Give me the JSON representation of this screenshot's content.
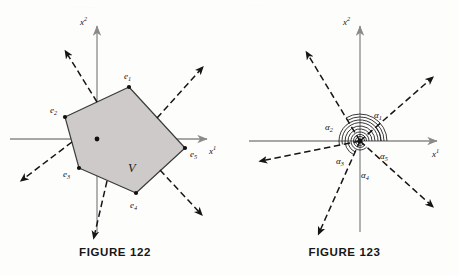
{
  "page": {
    "background": "#fdfdfc",
    "ink": "#101010",
    "axis_color": "#8a8a8a",
    "polygon_fill": "#cdcac9",
    "polygon_stroke": "#3a3a3a"
  },
  "figures": [
    {
      "id": "figure-122",
      "caption": "FIGURE 122",
      "axes": {
        "x_label": "x",
        "x_superscript": "1",
        "y_label": "x",
        "y_superscript": "2",
        "origin": {
          "x": 97,
          "y": 139
        }
      },
      "region_label": "V",
      "region_label_pos": {
        "x": 128,
        "y": 170
      },
      "vertices": [
        {
          "name": "e",
          "sub": "1",
          "x": 129,
          "y": 87,
          "label_x": 125,
          "label_y": 79
        },
        {
          "name": "e",
          "sub": "2",
          "x": 65,
          "y": 117,
          "label_x": 52,
          "label_y": 113
        },
        {
          "name": "e",
          "sub": "3",
          "x": 79,
          "y": 168,
          "label_x": 66,
          "label_y": 176
        },
        {
          "name": "e",
          "sub": "4",
          "x": 136,
          "y": 193,
          "label_x": 131,
          "label_y": 207
        },
        {
          "name": "e",
          "sub": "5",
          "x": 185,
          "y": 148,
          "label_x": 190,
          "label_y": 157
        }
      ],
      "normals": [
        {
          "from_x": 97,
          "from_y": 102,
          "to_x": 66,
          "to_y": 52
        },
        {
          "from_x": 72,
          "from_y": 142,
          "to_x": 22,
          "to_y": 180
        },
        {
          "from_x": 107,
          "from_y": 181,
          "to_x": 94,
          "to_y": 237
        },
        {
          "from_x": 160,
          "from_y": 170,
          "to_x": 201,
          "to_y": 214
        },
        {
          "from_x": 157,
          "from_y": 118,
          "to_x": 202,
          "to_y": 68
        }
      ]
    },
    {
      "id": "figure-123",
      "caption": "FIGURE 123",
      "axes": {
        "x_label": "x",
        "x_superscript": "1",
        "y_label": "x",
        "y_superscript": "2",
        "origin": {
          "x": 360,
          "y": 141
        }
      },
      "rays": [
        {
          "name": "α",
          "sub": "1",
          "angle_deg": 41,
          "length": 96,
          "arc_radius": 21,
          "label_x": 377,
          "label_y": 116
        },
        {
          "name": "α",
          "sub": "2",
          "angle_deg": 121,
          "length": 103,
          "arc_radius": 27,
          "label_x": 329,
          "label_y": 128
        },
        {
          "name": "α",
          "sub": "3",
          "angle_deg": 191,
          "length": 101,
          "arc_radius": 24,
          "label_x": 340,
          "label_y": 162
        },
        {
          "name": "α",
          "sub": "4",
          "angle_deg": 246,
          "length": 101,
          "arc_radius": 18,
          "label_x": 364,
          "label_y": 176
        },
        {
          "name": "α",
          "sub": "5",
          "angle_deg": 318,
          "length": 97,
          "arc_radius": 14,
          "label_x": 383,
          "label_y": 157
        }
      ]
    }
  ]
}
